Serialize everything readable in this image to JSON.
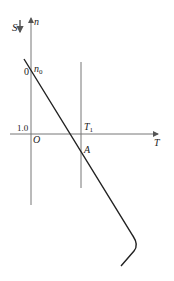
{
  "diagram": {
    "axes": {
      "vertical_label": "n",
      "horizontal_label": "T",
      "origin_label": "O",
      "s_label": "S"
    },
    "labels": {
      "zero": "0",
      "n0": "n",
      "n0_sub": "0",
      "one": "1.0",
      "t1": "T",
      "t1_sub": "1",
      "a": "A"
    },
    "colors": {
      "axis": "#777777",
      "curve": "#222222",
      "text": "#222222"
    }
  }
}
